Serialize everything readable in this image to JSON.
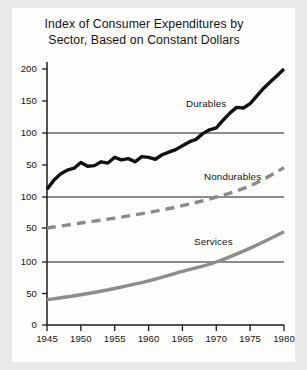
{
  "chart_data": {
    "type": "line",
    "title": "Index of Consumer Expenditures by Sector, Based on Constant Dollars",
    "title_lines": [
      "Index of Consumer Expenditures by",
      "Sector, Based on Constant Dollars"
    ],
    "xlabel": "",
    "ylabel": "",
    "grid": false,
    "legend_position": "inline-annotations",
    "xlim": [
      1945,
      1980
    ],
    "x_ticks": [
      1945,
      1950,
      1955,
      1960,
      1965,
      1970,
      1975,
      1980
    ],
    "x_tick_labels": [
      "1945",
      "1950",
      "1955",
      "1960",
      "1965",
      "1970",
      "1975",
      "1980"
    ],
    "panels": [
      {
        "name": "Durables",
        "label": "Durables",
        "ylim": [
          0,
          215
        ],
        "y_ticks": [
          50,
          100,
          150,
          200
        ],
        "y_tick_labels": [
          "50",
          "100",
          "150",
          "200"
        ],
        "baseline_value": 100,
        "color": "#111111",
        "style": "solid",
        "width": 3.4
      },
      {
        "name": "Nondurables",
        "label": "Nondurables",
        "ylim": [
          0,
          155
        ],
        "y_ticks": [
          50,
          100
        ],
        "y_tick_labels": [
          "50",
          "100"
        ],
        "baseline_value": 100,
        "color": "#8a8a8a",
        "style": "dashed",
        "width": 3.4
      },
      {
        "name": "Services",
        "label": "Services",
        "ylim": [
          0,
          155
        ],
        "y_ticks": [
          0,
          50,
          100
        ],
        "y_tick_labels": [
          "0",
          "50",
          "100"
        ],
        "baseline_value": 100,
        "color": "#8d8d8d",
        "style": "solid",
        "width": 3.4
      }
    ],
    "series": [
      {
        "name": "Durables",
        "panel": 0,
        "x": [
          1945,
          1946,
          1947,
          1948,
          1949,
          1950,
          1951,
          1952,
          1953,
          1954,
          1955,
          1956,
          1957,
          1958,
          1959,
          1960,
          1961,
          1962,
          1963,
          1964,
          1965,
          1966,
          1967,
          1968,
          1969,
          1970,
          1971,
          1972,
          1973,
          1974,
          1975,
          1976,
          1977,
          1978,
          1979,
          1980
        ],
        "values": [
          12,
          26,
          36,
          42,
          45,
          54,
          48,
          49,
          55,
          53,
          62,
          58,
          60,
          55,
          63,
          62,
          59,
          66,
          70,
          74,
          80,
          86,
          90,
          99,
          105,
          108,
          120,
          131,
          140,
          139,
          146,
          158,
          170,
          180,
          190,
          200
        ]
      },
      {
        "name": "Nondurables",
        "panel": 1,
        "x": [
          1945,
          1950,
          1955,
          1960,
          1965,
          1970,
          1975,
          1980
        ],
        "values": [
          50,
          58,
          66,
          75,
          86,
          100,
          118,
          147
        ]
      },
      {
        "name": "Services",
        "panel": 2,
        "x": [
          1945,
          1950,
          1955,
          1960,
          1965,
          1970,
          1975,
          1980
        ],
        "values": [
          40,
          48,
          58,
          70,
          85,
          100,
          122,
          148
        ]
      }
    ],
    "annotations": [
      {
        "text": "Durables",
        "x_px": 186,
        "y_px": 98
      },
      {
        "text": "Nondurables",
        "x_px": 204,
        "y_px": 171
      },
      {
        "text": "Services",
        "x_px": 194,
        "y_px": 236
      }
    ]
  }
}
